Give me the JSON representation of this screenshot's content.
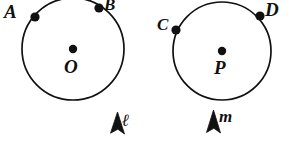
{
  "figure": {
    "type": "geometry-diagram",
    "background_color": "#ffffff",
    "stroke_color": "#111111",
    "circles": [
      {
        "id": "circle-o",
        "center_label": "O",
        "center": {
          "x": 73,
          "y": 49
        },
        "radius": 51,
        "points": [
          {
            "label": "A",
            "x": 35,
            "y": 17,
            "label_x": 4,
            "label_y": 2
          },
          {
            "label": "B",
            "x": 99,
            "y": 8,
            "label_x": 104,
            "label_y": -4
          }
        ],
        "marker": {
          "label": "l",
          "glyph": "ℓ",
          "x": 110,
          "y": 112
        }
      },
      {
        "id": "circle-p",
        "center_label": "P",
        "center": {
          "x": 222,
          "y": 51
        },
        "radius": 49,
        "points": [
          {
            "label": "C",
            "x": 176,
            "y": 30,
            "label_x": 157,
            "label_y": 16
          },
          {
            "label": "D",
            "x": 260,
            "y": 16,
            "label_x": 265,
            "label_y": 0
          }
        ],
        "marker": {
          "label": "m",
          "glyph": "m",
          "x": 206,
          "y": 112
        }
      }
    ],
    "labels": {
      "point_a": "A",
      "point_b": "B",
      "point_c": "C",
      "point_d": "D",
      "center_o": "O",
      "center_p": "P",
      "marker_l": "ℓ",
      "marker_m": "m"
    }
  }
}
